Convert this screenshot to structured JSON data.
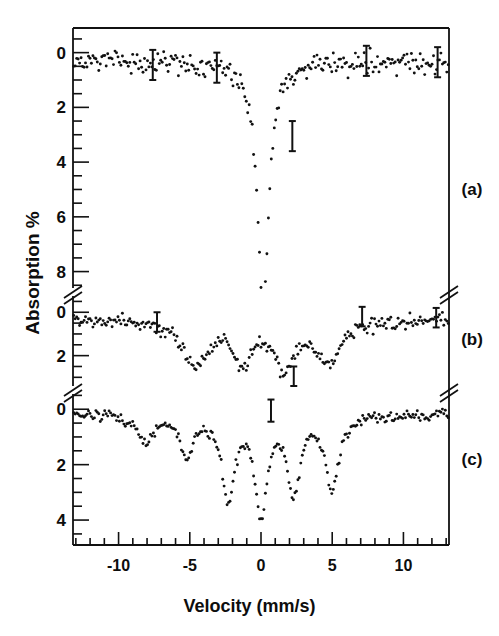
{
  "figure": {
    "title": "",
    "xlabel": "Velocity  (mm/s)",
    "ylabel": "Absorption %",
    "panel_labels": [
      "(a)",
      "(b)",
      "(c)"
    ]
  },
  "axes": {
    "x_ticks_major": [
      -10,
      -5,
      0,
      5,
      10
    ],
    "x_tick_labels": [
      "-10",
      "-5",
      "0",
      "5",
      "10"
    ],
    "x_minor_step": 1,
    "x_range": [
      -13.2,
      13.2
    ],
    "panel_a_y_labels": [
      "0",
      "2",
      "4",
      "6",
      "8"
    ],
    "panel_b_y_labels": [
      "0",
      "2"
    ],
    "panel_c_y_labels": [
      "0",
      "2",
      "4"
    ]
  },
  "chart_data": {
    "type": "scatter",
    "title": "",
    "xlabel": "Velocity  (mm/s)",
    "ylabel": "Absorption %",
    "xlim": [
      -13.2,
      13.2
    ],
    "grid": false,
    "legend": "none",
    "panels": [
      {
        "name": "(a)",
        "ylim": [
          8.6,
          -0.9
        ],
        "yticks": [
          0,
          2,
          4,
          6,
          8
        ],
        "y_minor_step": 0.5,
        "description": "single deep absorption line centred near 0 mm/s",
        "baseline": 0.35,
        "noise": 0.33,
        "lines": [
          {
            "center": 0.15,
            "depth": 9.2,
            "width": 0.95
          }
        ],
        "error_bars": [
          {
            "x": -7.6,
            "y": 0.45,
            "half": 0.55
          },
          {
            "x": -3.1,
            "y": 0.55,
            "half": 0.55
          },
          {
            "x": 2.2,
            "y": 3.05,
            "half": 0.55
          },
          {
            "x": 7.4,
            "y": 0.3,
            "half": 0.55
          },
          {
            "x": 12.4,
            "y": 0.35,
            "half": 0.55
          }
        ]
      },
      {
        "name": "(b)",
        "ylim": [
          3.4,
          -0.75
        ],
        "yticks": [
          0,
          2
        ],
        "y_minor_step": 0.5,
        "description": "broad unresolved magnetic pattern, two main wings with central structure",
        "baseline": 0.3,
        "noise": 0.26,
        "lines": [
          {
            "center": -4.6,
            "depth": 2.05,
            "width": 2.25
          },
          {
            "center": -1.3,
            "depth": 1.85,
            "width": 1.55
          },
          {
            "center": 1.6,
            "depth": 2.1,
            "width": 1.65
          },
          {
            "center": 4.7,
            "depth": 1.95,
            "width": 2.2
          }
        ],
        "error_bars": [
          {
            "x": -7.3,
            "y": 0.45,
            "half": 0.45
          },
          {
            "x": 2.3,
            "y": 2.95,
            "half": 0.45
          },
          {
            "x": 7.1,
            "y": 0.2,
            "half": 0.45
          },
          {
            "x": 12.3,
            "y": 0.25,
            "half": 0.45
          }
        ]
      },
      {
        "name": "(c)",
        "ylim": [
          4.9,
          -0.55
        ],
        "yticks": [
          0,
          2,
          4
        ],
        "y_minor_step": 0.5,
        "description": "resolved six-line magnetic hyperfine pattern",
        "baseline": 0.18,
        "noise": 0.17,
        "lines": [
          {
            "center": -8.1,
            "depth": 0.95,
            "width": 1.3
          },
          {
            "center": -5.2,
            "depth": 1.45,
            "width": 1.1
          },
          {
            "center": -2.3,
            "depth": 2.95,
            "width": 1.05
          },
          {
            "center": 0.0,
            "depth": 3.5,
            "width": 1.0
          },
          {
            "center": 2.3,
            "depth": 2.75,
            "width": 1.05
          },
          {
            "center": 5.0,
            "depth": 2.6,
            "width": 1.15
          }
        ],
        "error_bars": [
          {
            "x": 0.7,
            "y": 0.05,
            "half": 0.4
          }
        ]
      }
    ]
  }
}
